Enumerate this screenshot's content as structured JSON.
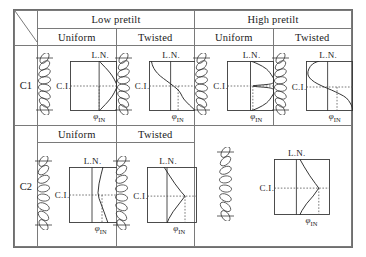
{
  "figure": {
    "title": "",
    "corner_cell": {
      "divider": "diagonal-slash"
    },
    "column_groups": [
      {
        "label": "Low pretilt",
        "subcolumns": [
          "Uniform",
          "Twisted"
        ]
      },
      {
        "label": "High pretilt",
        "subcolumns": [
          "Uniform",
          "Twisted"
        ]
      }
    ],
    "row_labels": [
      "C1",
      "C2"
    ],
    "axis": {
      "x_label_symbol": "φ",
      "x_label_subscript": "IN",
      "layer_normal_label": "L.N.",
      "chevron_interface_label": "C.I."
    },
    "colors": {
      "border": "#7a7a7a",
      "outer_border": "#6e6e6e",
      "stroke": "#3a3a3a",
      "curve": "#2b2b2b",
      "dotted": "#555555",
      "background": "#ffffff"
    }
  },
  "chart_data": {
    "type": "line",
    "xlabel": "φ IN",
    "ylabel": "position across cell gap",
    "grid": false,
    "legend": "none",
    "annotations": [
      "L.N.",
      "C.I."
    ],
    "panels": [
      {
        "row": "C1",
        "pretilt": "Low pretilt",
        "state": "Uniform",
        "description": "Curve bows to the right from top, meets C.I. node near mid-right, bows right again to bottom",
        "x": [
          0.62,
          0.7,
          0.8,
          0.9,
          0.97,
          1.0,
          0.97,
          0.9,
          0.8,
          0.7,
          0.62
        ],
        "y": [
          0.0,
          0.08,
          0.18,
          0.3,
          0.42,
          0.5,
          0.58,
          0.7,
          0.82,
          0.92,
          1.0
        ],
        "ln_x": 0.62,
        "ci_y": 0.5,
        "node_x": 0.62
      },
      {
        "row": "C1",
        "pretilt": "Low pretilt",
        "state": "Twisted",
        "description": "Monotonic decreasing S-curve from upper-left to lower-right",
        "x": [
          0.05,
          0.08,
          0.14,
          0.24,
          0.38,
          0.52,
          0.62,
          0.68,
          0.74,
          0.86,
          1.0
        ],
        "y": [
          0.0,
          0.1,
          0.2,
          0.3,
          0.4,
          0.5,
          0.58,
          0.66,
          0.76,
          0.88,
          1.0
        ],
        "ln_x": 0.46,
        "ci_y": 0.5,
        "node_x": 0.62
      },
      {
        "row": "C1",
        "pretilt": "High pretilt",
        "state": "Uniform",
        "description": "Large right-bulging loop; returns to L.N. at top and bottom, node at C.I.",
        "x": [
          0.5,
          0.66,
          0.84,
          0.96,
          1.0,
          0.92,
          0.55,
          0.92,
          1.0,
          0.96,
          0.84,
          0.66,
          0.5
        ],
        "y": [
          0.0,
          0.06,
          0.16,
          0.3,
          0.4,
          0.46,
          0.5,
          0.54,
          0.6,
          0.7,
          0.84,
          0.94,
          1.0
        ],
        "ln_x": 0.5,
        "ci_y": 0.5,
        "node_x": 0.55
      },
      {
        "row": "C1",
        "pretilt": "High pretilt",
        "state": "Twisted",
        "description": "Strong left bulge in the upper half, crossing to the right at the bottom",
        "x": [
          0.28,
          0.14,
          0.06,
          0.04,
          0.08,
          0.18,
          0.34,
          0.54,
          0.72,
          0.86,
          0.94,
          0.98,
          1.0
        ],
        "y": [
          0.0,
          0.06,
          0.16,
          0.26,
          0.34,
          0.42,
          0.5,
          0.58,
          0.66,
          0.74,
          0.84,
          0.92,
          1.0
        ],
        "ln_x": 0.46,
        "ci_y": 0.52,
        "node_x": 0.66
      },
      {
        "row": "C2",
        "pretilt": "Low pretilt",
        "state": "Uniform",
        "description": "Nearly vertical line, slightly bowed left in the middle",
        "x": [
          0.68,
          0.64,
          0.6,
          0.58,
          0.6,
          0.65,
          0.7,
          0.74,
          0.78
        ],
        "y": [
          0.0,
          0.14,
          0.3,
          0.46,
          0.56,
          0.68,
          0.8,
          0.9,
          1.0
        ],
        "ln_x": 0.46,
        "ci_y": 0.5,
        "node_x": 0.66
      },
      {
        "row": "C2",
        "pretilt": "Low pretilt",
        "state": "Twisted",
        "description": "Triangular kink: straight from upper-left down-right to C.I. node then back left to bottom",
        "x": [
          0.34,
          0.44,
          0.56,
          0.68,
          0.76,
          0.64,
          0.52,
          0.44,
          0.4
        ],
        "y": [
          0.0,
          0.14,
          0.3,
          0.44,
          0.52,
          0.66,
          0.8,
          0.92,
          1.0
        ],
        "ln_x": 0.4,
        "ci_y": 0.52,
        "node_x": 0.76
      },
      {
        "row": "C2",
        "pretilt": "High pretilt",
        "state": "merged",
        "description": "Single merged panel spanning Uniform and Twisted; triangular kink meeting C.I. node at right",
        "x": [
          0.46,
          0.54,
          0.64,
          0.74,
          0.8,
          0.7,
          0.58,
          0.5,
          0.46
        ],
        "y": [
          0.0,
          0.14,
          0.3,
          0.44,
          0.52,
          0.66,
          0.8,
          0.92,
          1.0
        ],
        "ln_x": 0.4,
        "ci_y": 0.52,
        "node_x": 0.8
      }
    ],
    "director_chain": {
      "description": "Vertical stack of overlapping tilted ellipses representing liquid-crystal directors between two substrate plates",
      "ellipse_count": 8,
      "plate_marks": [
        "top",
        "bottom"
      ]
    }
  }
}
